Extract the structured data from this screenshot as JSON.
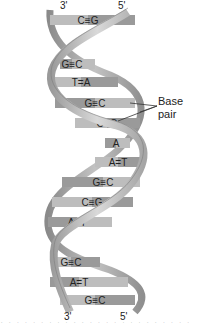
{
  "diagram": {
    "strand_ends": {
      "top_left": "3'",
      "top_right": "5'",
      "bottom_left": "3'",
      "bottom_right": "5'"
    },
    "callout": {
      "line1": "Base",
      "line2": "pair"
    },
    "base_pairs": [
      {
        "left": "C",
        "right": "G",
        "bond": "≡",
        "y": 20,
        "x1": 50,
        "x2": 135,
        "tx": 88
      },
      {
        "left": "G",
        "right": "C",
        "bond": "≡",
        "y": 64,
        "x1": 60,
        "x2": 95,
        "tx": 72
      },
      {
        "left": "T",
        "right": "A",
        "bond": "=",
        "y": 82,
        "x1": 52,
        "x2": 118,
        "tx": 81
      },
      {
        "left": "G",
        "right": "C",
        "bond": "≡",
        "y": 103,
        "x1": 55,
        "x2": 135,
        "tx": 95
      },
      {
        "left": "C",
        "right": "G",
        "bond": "≡",
        "y": 123,
        "x1": 75,
        "x2": 140,
        "tx": 107
      },
      {
        "left": "A",
        "right": "",
        "bond": "",
        "y": 143,
        "x1": 105,
        "x2": 130,
        "tx": 116
      },
      {
        "left": "A",
        "right": "T",
        "bond": "=",
        "y": 162,
        "x1": 95,
        "x2": 140,
        "tx": 118
      },
      {
        "left": "G",
        "right": "C",
        "bond": "≡",
        "y": 182,
        "x1": 62,
        "x2": 140,
        "tx": 103
      },
      {
        "left": "C",
        "right": "G",
        "bond": "≡",
        "y": 202,
        "x1": 52,
        "x2": 133,
        "tx": 92
      },
      {
        "left": "A",
        "right": "T",
        "bond": "=",
        "y": 222,
        "x1": 48,
        "x2": 112,
        "tx": 77
      },
      {
        "left": "G",
        "right": "C",
        "bond": "≡",
        "y": 262,
        "x1": 55,
        "x2": 100,
        "tx": 71
      },
      {
        "left": "A",
        "right": "T",
        "bond": "=",
        "y": 282,
        "x1": 50,
        "x2": 128,
        "tx": 79
      },
      {
        "left": "G",
        "right": "C",
        "bond": "≡",
        "y": 300,
        "x1": 60,
        "x2": 135,
        "tx": 95
      }
    ],
    "colors": {
      "background": "#ffffff",
      "backbone": "#b8b8b8",
      "backbone_dark": "#8c8c8c",
      "backbone_light": "#d6d6d6",
      "pair_light": "#bdbdbd",
      "pair_dark": "#9a9a9a",
      "text": "#222222"
    },
    "bottom_cut_text": "· · · · · · · · · · · · · · · · · · · · · · · ·"
  }
}
